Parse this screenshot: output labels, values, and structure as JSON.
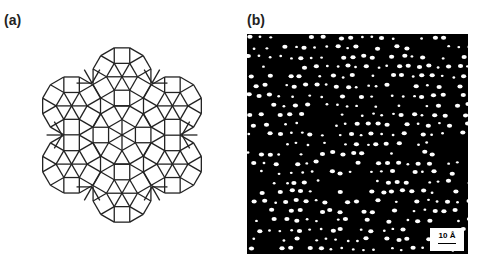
{
  "panels": [
    {
      "label": "(a)",
      "description": "square-triangle dodecagonal tiling"
    },
    {
      "label": "(b)",
      "description": "high-resolution image of bright dots",
      "scale_bar": "10 Å"
    }
  ],
  "colors": {
    "line": "#222222",
    "background": "#000000",
    "dots": "#ffffff"
  }
}
